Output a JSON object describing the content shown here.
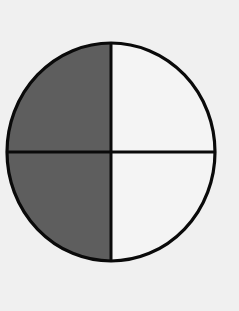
{
  "diagram": {
    "shape": "circle",
    "total_parts": 4,
    "shaded_parts": 2,
    "fraction_shaded": "2/4",
    "shaded_quadrants": [
      "top-left",
      "bottom-left"
    ],
    "unshaded_quadrants": [
      "top-right",
      "bottom-right"
    ],
    "colors": {
      "background": "#f0f0f0",
      "shaded": "#5e5e5e",
      "unshaded": "#f4f4f4",
      "stroke": "#0a0a0a"
    }
  }
}
